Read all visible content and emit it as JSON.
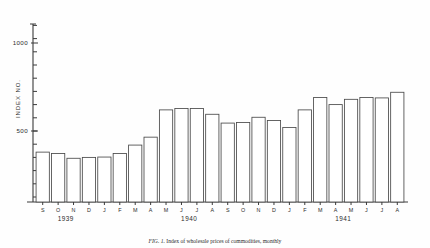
{
  "figure": {
    "caption_lead": "FIG. 1.",
    "caption_text": "Index of wholesale prices of commodities, monthly"
  },
  "chart_data": {
    "type": "bar",
    "title": "",
    "xlabel": "",
    "ylabel": "INDEX NO.",
    "ylim": [
      0,
      1200
    ],
    "grid": false,
    "legend": "none",
    "y_ticks": [
      500,
      1000
    ],
    "y_tick_labels": [
      "500",
      "1000"
    ],
    "y_minor_tick_step": 75,
    "categories": [
      "S",
      "O",
      "N",
      "D",
      "J",
      "F",
      "M",
      "A",
      "M",
      "J",
      "J",
      "A",
      "S",
      "O",
      "N",
      "D",
      "J",
      "F",
      "M",
      "A",
      "M",
      "J",
      "J",
      "A"
    ],
    "values": [
      380,
      372,
      345,
      350,
      352,
      372,
      420,
      465,
      620,
      628,
      628,
      595,
      545,
      548,
      578,
      560,
      520,
      620,
      690,
      650,
      680,
      690,
      688,
      720
    ],
    "year_groups": [
      {
        "label": "1939",
        "start_index": 0,
        "count": 4
      },
      {
        "label": "1940",
        "start_index": 4,
        "count": 12
      },
      {
        "label": "1941",
        "start_index": 16,
        "count": 8
      }
    ]
  }
}
